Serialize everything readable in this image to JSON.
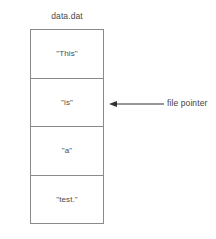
{
  "diagram": {
    "title": "data.dat",
    "records": [
      {
        "label": "\"This\""
      },
      {
        "label": "\"is\""
      },
      {
        "label": "\"a\""
      },
      {
        "label": "\"test.\""
      }
    ],
    "annotation": {
      "label": "file pointer",
      "arrow_icon": "arrow-left-icon",
      "points_to_record_index": 1
    },
    "colors": {
      "background": "#ffffff",
      "border": "#8a8a8a",
      "text": "#4a4a4a",
      "arrow": "#2e2e2e"
    }
  }
}
